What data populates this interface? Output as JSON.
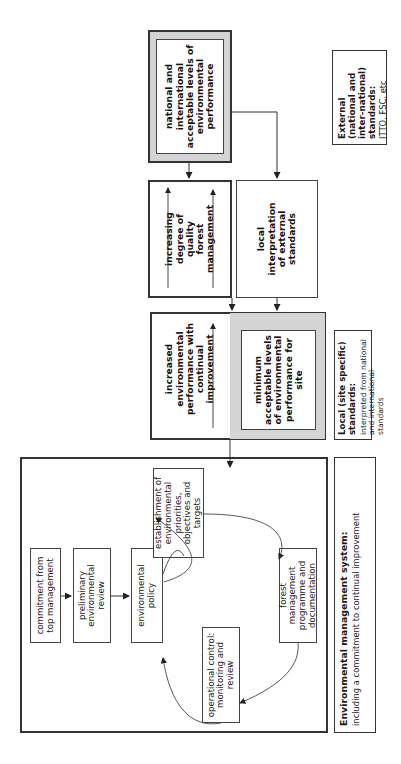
{
  "diagram": {
    "ems": {
      "steps": {
        "commitment": "commitment from top management",
        "preliminary": "preliminary environmental review",
        "policy": "environmental policy",
        "establishment": "establishment of environmental priorities, objectives and targets",
        "programme": "forest management programme and documentation",
        "operational": "operational control: monitoring and review"
      },
      "label_title": "Environmental management system:",
      "label_subtitle": "including a commitment to continual improvement"
    },
    "local": {
      "increased": "increased environmental performance with continual improvement",
      "minimum": "minimum acceptable levels of environmental performance for site",
      "label_title": "Local (site specific) standards:",
      "label_subtitle": "interpreted from national and international standards"
    },
    "middle": {
      "increasing": "increasing degree of quality forest management",
      "interpretation": "local interpretation of external standards"
    },
    "external": {
      "national": "national and international acceptable levels of environmental performance",
      "label_title": "External (national and inter-national) standards:",
      "label_subtitle": "ITTO, FSC, etc"
    },
    "colors": {
      "grey_fill": "#d4d4d4",
      "border": "#333333"
    }
  }
}
